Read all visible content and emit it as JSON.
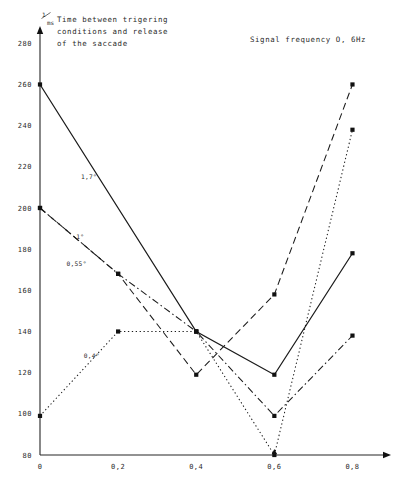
{
  "figure": {
    "title_lines": [
      "Time between trigering",
      "conditions and release",
      "of the saccade"
    ],
    "annotation": "Signal frequency O, 6Hz",
    "y_axis_unit_numerator": "1",
    "y_axis_unit_denominator": "ms"
  },
  "chart_data": {
    "type": "line",
    "subtitle": "Signal frequency O, 6Hz",
    "xlabel": "",
    "ylabel": "1/ms",
    "x": [
      0,
      0.2,
      0.4,
      0.6,
      0.8
    ],
    "xtick_labels": [
      "0",
      "0,2",
      "0,4",
      "0,6",
      "0,8"
    ],
    "ytick_labels": [
      "80",
      "100",
      "120",
      "140",
      "160",
      "180",
      "200",
      "220",
      "240",
      "260",
      "280"
    ],
    "yticks": [
      80,
      100,
      120,
      140,
      160,
      180,
      200,
      220,
      240,
      260,
      280
    ],
    "xlim": [
      0,
      0.85
    ],
    "ylim": [
      80,
      285
    ],
    "grid": false,
    "legend_position": "inline-annotations",
    "series": [
      {
        "name": "1,7°",
        "style": "solid",
        "label_x": 0.105,
        "label_y": 214,
        "x": [
          0,
          0.4,
          0.6,
          0.8
        ],
        "values": [
          260,
          140,
          119,
          178
        ]
      },
      {
        "name": "1°",
        "style": "dashed",
        "label_x": 0.093,
        "label_y": 185,
        "x": [
          0,
          0.2,
          0.4,
          0.6,
          0.8
        ],
        "values": [
          200,
          168,
          119,
          158,
          260
        ]
      },
      {
        "name": "0,55°",
        "style": "dashdot",
        "label_x": 0.068,
        "label_y": 172,
        "x": [
          0,
          0.2,
          0.4,
          0.6,
          0.8
        ],
        "values": [
          200,
          168,
          140,
          99,
          138
        ]
      },
      {
        "name": "0,4°",
        "style": "dotted",
        "label_x": 0.112,
        "label_y": 127,
        "x": [
          0,
          0.2,
          0.4,
          0.6,
          0.8
        ],
        "values": [
          99,
          140,
          140,
          80,
          238
        ]
      }
    ]
  }
}
